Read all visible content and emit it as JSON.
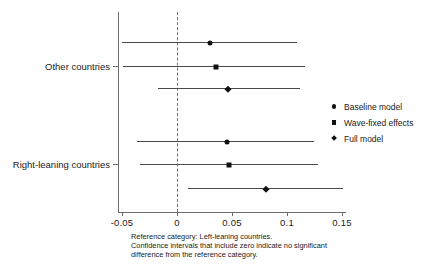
{
  "chart_data": {
    "type": "scatter",
    "title": "",
    "xlabel": "",
    "ylabel": "",
    "xlim": [
      -0.062,
      0.158
    ],
    "ylim": [
      0,
      7
    ],
    "grid": false,
    "legend_position": "right",
    "reference_line": 0,
    "reference_line_style": "dashed",
    "categories": [
      "Other countries",
      "Right-leaning countries"
    ],
    "tick_labels": [
      "-0.05",
      "0",
      "0.05",
      "0.1",
      "0.15"
    ],
    "tick_values": [
      -0.05,
      0,
      0.05,
      0.1,
      0.15
    ],
    "legend": [
      {
        "label": "Baseline model",
        "marker": "circle"
      },
      {
        "label": "Wave-fixed effects",
        "marker": "square"
      },
      {
        "label": "Full model",
        "marker": "diamond"
      }
    ],
    "series": [
      {
        "name": "Baseline model",
        "marker": "circle",
        "points": [
          {
            "group": "Other countries",
            "estimate": 0.03,
            "ci_low": -0.05,
            "ci_high": 0.109,
            "significant": false
          },
          {
            "group": "Right-leaning countries",
            "estimate": 0.045,
            "ci_low": -0.036,
            "ci_high": 0.125,
            "significant": false
          }
        ]
      },
      {
        "name": "Wave-fixed effects",
        "marker": "square",
        "points": [
          {
            "group": "Other countries",
            "estimate": 0.035,
            "ci_low": -0.049,
            "ci_high": 0.116,
            "significant": false
          },
          {
            "group": "Right-leaning countries",
            "estimate": 0.047,
            "ci_low": -0.034,
            "ci_high": 0.128,
            "significant": false
          }
        ]
      },
      {
        "name": "Full model",
        "marker": "diamond",
        "points": [
          {
            "group": "Other countries",
            "estimate": 0.046,
            "ci_low": -0.017,
            "ci_high": 0.112,
            "significant": false
          },
          {
            "group": "Right-leaning countries",
            "estimate": 0.081,
            "ci_low": 0.01,
            "ci_high": 0.151,
            "significant": true
          }
        ]
      }
    ],
    "rows": [
      {
        "row": 1,
        "group": "Other countries",
        "series": "Baseline model",
        "marker": "circle",
        "estimate": 0.03,
        "ci_low": -0.05,
        "ci_high": 0.109
      },
      {
        "row": 2,
        "group": "Other countries",
        "series": "Wave-fixed effects",
        "marker": "square",
        "estimate": 0.035,
        "ci_low": -0.049,
        "ci_high": 0.116
      },
      {
        "row": 3,
        "group": "Other countries",
        "series": "Full model",
        "marker": "diamond",
        "estimate": 0.046,
        "ci_low": -0.017,
        "ci_high": 0.112
      },
      {
        "row": 4,
        "group": "Right-leaning countries",
        "series": "Baseline model",
        "marker": "circle",
        "estimate": 0.045,
        "ci_low": -0.036,
        "ci_high": 0.125
      },
      {
        "row": 5,
        "group": "Right-leaning countries",
        "series": "Wave-fixed effects",
        "marker": "square",
        "estimate": 0.047,
        "ci_low": -0.034,
        "ci_high": 0.128
      },
      {
        "row": 6,
        "group": "Right-leaning countries",
        "series": "Full model",
        "marker": "diamond",
        "estimate": 0.081,
        "ci_low": 0.01,
        "ci_high": 0.151
      }
    ],
    "caption_lines": [
      "Reference category: Left-leaning countries.",
      "Confidence intervals that include zero indicate no significant",
      "difference from the reference category."
    ]
  }
}
